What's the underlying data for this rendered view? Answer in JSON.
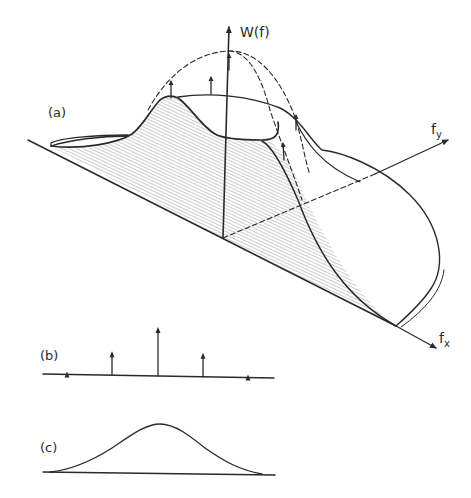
{
  "figure": {
    "panels": [
      {
        "id": "a",
        "label": "(a)",
        "description": "3-D power spectrum surface W(f) over (f_x, f_y) plane, with dashed envelope and impulse arrows"
      },
      {
        "id": "b",
        "label": "(b)",
        "description": "1-D line spectrum: five impulses, symmetric about centre"
      },
      {
        "id": "c",
        "label": "(c)",
        "description": "1-D continuous bell-shaped spectrum"
      }
    ],
    "axes": {
      "vertical": "W(f)",
      "fy_base": "f",
      "fy_sub": "y",
      "fx_base": "f",
      "fx_sub": "x"
    },
    "labels": {
      "a": "(a)",
      "b": "(b)",
      "c": "(c)",
      "w_of_f": "W(f)"
    },
    "colors": {
      "ink": "#2a2a2a",
      "hatch": "#9a9a9a",
      "background": "#ffffff"
    }
  },
  "chart_data": {
    "type": "bar",
    "categories": [
      "-2",
      "-1",
      "0",
      "1",
      "2"
    ],
    "values": [
      3,
      24,
      49,
      24,
      3
    ],
    "xlabel": "",
    "ylabel": "",
    "ylim": [
      0,
      50
    ]
  }
}
